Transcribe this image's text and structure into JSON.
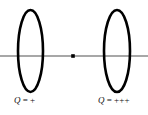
{
  "figure": {
    "type": "physics-diagram",
    "background_color": "#ffffff",
    "axis": {
      "color": "#8a8a8a",
      "y": 56,
      "x_start": 0,
      "x_end": 148,
      "stroke_width": 1.3
    },
    "center_point": {
      "name": "axis-point",
      "x": 73,
      "y": 56,
      "color": "#000000",
      "size": 3.6
    },
    "rings": [
      {
        "id": "left-ring",
        "color": "#000000",
        "stroke_width": 2.6,
        "cx": 30.5,
        "cy": 51,
        "rx": 12.5,
        "ry": 41,
        "charge_label": {
          "symbol": "Q",
          "equals": "=",
          "value": "+",
          "text": "Q = +"
        }
      },
      {
        "id": "right-ring",
        "color": "#000000",
        "stroke_width": 2.6,
        "cx": 117,
        "cy": 51,
        "rx": 13,
        "ry": 41,
        "charge_label": {
          "symbol": "Q",
          "equals": "=",
          "value": "+++",
          "text": "Q = +++"
        }
      }
    ]
  }
}
